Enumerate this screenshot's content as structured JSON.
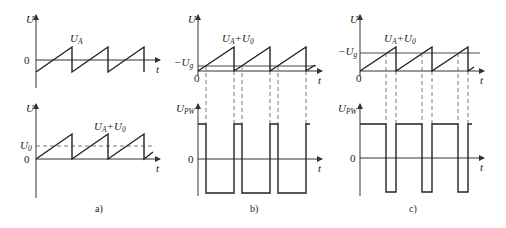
{
  "figure": {
    "panels": [
      {
        "id": "a",
        "caption": "a)",
        "top_plot": {
          "y_label": "U",
          "x_label": "t",
          "zero_label": "0",
          "signal_label_main": "U",
          "signal_label_sub": "A"
        },
        "bottom_plot": {
          "y_label": "U",
          "x_label": "t",
          "zero_label": "0",
          "ref_label_main": "U",
          "ref_label_sub": "0",
          "signal_label_main": "U",
          "signal_label_sub": "A",
          "signal_label_plus": "+U",
          "signal_label_sub2": "0"
        }
      },
      {
        "id": "b",
        "caption": "b)",
        "top_plot": {
          "y_label": "U",
          "x_label": "t",
          "zero_label": "0",
          "threshold_label_main": "−U",
          "threshold_label_sub": "g",
          "signal_label_main": "U",
          "signal_label_sub": "A",
          "signal_label_plus": "+U",
          "signal_label_sub2": "0"
        },
        "bottom_plot": {
          "y_label_main": "U",
          "y_label_sub": "PW",
          "x_label": "t",
          "zero_label": "0"
        }
      },
      {
        "id": "c",
        "caption": "c)",
        "top_plot": {
          "y_label": "U",
          "x_label": "t",
          "zero_label": "0",
          "threshold_label_main": "−U",
          "threshold_label_sub": "g",
          "signal_label_main": "U",
          "signal_label_sub": "A",
          "signal_label_plus": "+U",
          "signal_label_sub2": "0"
        },
        "bottom_plot": {
          "y_label_main": "U",
          "y_label_sub": "PW",
          "x_label": "t",
          "zero_label": "0"
        }
      }
    ],
    "colors": {
      "line": "#222222",
      "background": "#ffffff"
    }
  }
}
